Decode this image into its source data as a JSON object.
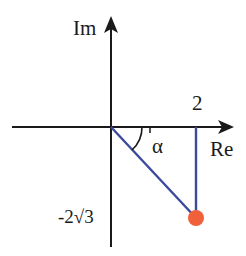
{
  "diagram": {
    "axes": {
      "imaginary_label": "Im",
      "real_label": "Re"
    },
    "labels": {
      "real_value": "2",
      "imag_value": "-2√3",
      "angle": "α"
    },
    "point": {
      "re": 2,
      "im": "-2√3"
    },
    "colors": {
      "axis": "#1a1a1a",
      "vector": "#3b4a9e",
      "point": "#f0603a"
    }
  }
}
